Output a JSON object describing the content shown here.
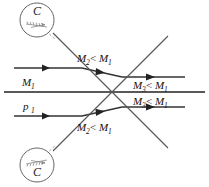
{
  "figure": {
    "kind": "oblique-shock-interaction-diagram",
    "background_color": "#ffffff",
    "line_color": "#222222",
    "shock_color": "#555555",
    "caption": ""
  },
  "callouts": {
    "top": {
      "letter": "C",
      "detail_name": "wedge-hatched-detail",
      "cx": 37,
      "cy": 20,
      "r": 17
    },
    "bottom": {
      "letter": "C",
      "detail_name": "wedge-hatched-detail",
      "cx": 37,
      "cy": 165,
      "r": 17
    }
  },
  "labels": {
    "upstream_mach": {
      "base": "M",
      "sub": "1",
      "text": "M1"
    },
    "upstream_pressure": {
      "base": "p",
      "sub": "1",
      "text": "p1"
    },
    "upper_middle": {
      "left_base": "M",
      "left_sub": "2",
      "op": "<",
      "right_base": "M",
      "right_sub": "1",
      "text": "M2 < M1"
    },
    "lower_middle": {
      "left_base": "M",
      "left_sub": "2",
      "op": "<",
      "right_base": "M",
      "right_sub": "1",
      "text": "M2 < M1"
    },
    "upper_right": {
      "left_base": "M",
      "left_sub": "3",
      "op": "<",
      "right_base": "M",
      "right_sub": "1",
      "text": "M3 < M1"
    },
    "lower_right": {
      "left_base": "M",
      "left_sub": "3",
      "op": "<",
      "right_base": "M",
      "right_sub": "1",
      "text": "M3 < M1"
    }
  },
  "geometry": {
    "centerline_y": 92,
    "upper_streamline_y": 68,
    "lower_streamline_y": 116,
    "crossing_x": 95,
    "crossing_y": 92,
    "upper_shock": {
      "x1": 53,
      "y1": 33,
      "x2": 168,
      "y2": 36
    },
    "lower_shock": {
      "x1": 53,
      "y1": 151,
      "x2": 168,
      "y2": 148
    }
  }
}
